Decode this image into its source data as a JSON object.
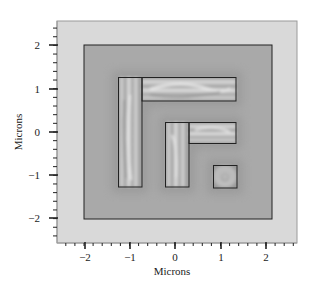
{
  "chart_data": {
    "type": "heatmap",
    "title": "",
    "xlabel": "Microns",
    "ylabel": "Microns",
    "xlim": [
      -2.6,
      2.7
    ],
    "ylim": [
      -2.6,
      2.6
    ],
    "xticks": [
      -2,
      -1,
      0,
      1,
      2
    ],
    "yticks": [
      -2,
      -1,
      0,
      1,
      2
    ],
    "xtick_labels": [
      "−2",
      "−1",
      "0",
      "1",
      "2"
    ],
    "ytick_labels": [
      "2",
      "1",
      "0",
      "−1",
      "−2"
    ],
    "minor_tick_step": 0.2,
    "grid": false,
    "legend": null,
    "regions": [
      {
        "name": "boundary-box",
        "x": [
          -2.0,
          2.12
        ],
        "y": [
          -2.0,
          2.0
        ]
      },
      {
        "name": "L-shape-1-vertical",
        "x": [
          -1.25,
          -0.73
        ],
        "y": [
          -1.27,
          1.27
        ]
      },
      {
        "name": "L-shape-1-horizontal",
        "x": [
          -0.73,
          1.34
        ],
        "y": [
          0.72,
          1.27
        ]
      },
      {
        "name": "L-shape-2-vertical",
        "x": [
          -0.22,
          0.31
        ],
        "y": [
          -1.27,
          0.23
        ]
      },
      {
        "name": "L-shape-2-horizontal",
        "x": [
          0.31,
          1.34
        ],
        "y": [
          -0.25,
          0.23
        ]
      },
      {
        "name": "square",
        "x": [
          0.84,
          1.37
        ],
        "y": [
          -1.29,
          -0.76
        ]
      }
    ],
    "colors": {
      "frame_bg": "#d9d9d9",
      "field_bg": "#a9a9a9",
      "halo": "#9c9c9c",
      "feature_light": "#e2e2e2",
      "feature_dark": "#7d7d7d",
      "outline": "#222222"
    }
  },
  "axes": {
    "xlabel": "Microns",
    "ylabel": "Microns",
    "x_ticks": [
      {
        "label": "−2",
        "px": 85
      },
      {
        "label": "−1",
        "px": 130
      },
      {
        "label": "0",
        "px": 175
      },
      {
        "label": "1",
        "px": 221
      },
      {
        "label": "2",
        "px": 266
      }
    ],
    "y_ticks": [
      {
        "label": "2",
        "py": 45
      },
      {
        "label": "1",
        "py": 89
      },
      {
        "label": "0",
        "py": 132
      },
      {
        "label": "−1",
        "py": 175
      },
      {
        "label": "−2",
        "py": 218
      }
    ]
  }
}
